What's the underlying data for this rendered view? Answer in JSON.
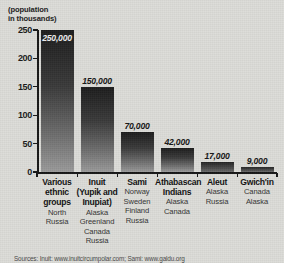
{
  "chart_data": {
    "type": "bar",
    "title": "",
    "axis_title": "(population\nin thousands)",
    "xlabel": "",
    "ylabel": "(population in thousands)",
    "ylim": [
      0,
      250
    ],
    "yticks": [
      0,
      50,
      100,
      150,
      200,
      250
    ],
    "ytick_labels": [
      "0",
      "50",
      "100",
      "150",
      "200",
      "250"
    ],
    "grid": false,
    "legend": "none",
    "units": "thousands",
    "categories": [
      "Various ethnic groups",
      "Inuit (Yupik and Inupiat)",
      "Sami",
      "Athabascan Indians",
      "Aleut",
      "Gwich'in"
    ],
    "values": [
      250,
      150,
      70,
      42,
      17,
      9
    ],
    "data_labels": [
      "250,000",
      "150,000",
      "70,000",
      "42,000",
      "17,000",
      "9,000"
    ],
    "raw_values": [
      250000,
      150000,
      70000,
      42000,
      17000,
      9000
    ],
    "bars": [
      {
        "name_lines": [
          "Various",
          "ethnic",
          "groups"
        ],
        "regions": [
          "North",
          "Russia"
        ],
        "value": 250,
        "label": "250,000",
        "label_position": "inside"
      },
      {
        "name_lines": [
          "Inuit",
          "(Yupik and",
          "Inupiat)"
        ],
        "regions": [
          "Alaska",
          "Greenland",
          "Canada",
          "Russia"
        ],
        "value": 150,
        "label": "150,000",
        "label_position": "above"
      },
      {
        "name_lines": [
          "Sami"
        ],
        "regions": [
          "Norway",
          "Sweden",
          "Finland",
          "Russia"
        ],
        "value": 70,
        "label": "70,000",
        "label_position": "above"
      },
      {
        "name_lines": [
          "Athabascan",
          "Indians"
        ],
        "regions": [
          "Alaska",
          "Canada"
        ],
        "value": 42,
        "label": "42,000",
        "label_position": "above"
      },
      {
        "name_lines": [
          "Aleut"
        ],
        "regions": [
          "Alaska",
          "Russia"
        ],
        "value": 17,
        "label": "17,000",
        "label_position": "above"
      },
      {
        "name_lines": [
          "Gwich'in"
        ],
        "regions": [
          "Canada",
          "Alaska"
        ],
        "value": 9,
        "label": "9,000",
        "label_position": "above"
      }
    ]
  },
  "source": {
    "text": "Sources: Inuit: www.inuitcircumpolar.com;  Sami: www.galdu.org"
  },
  "colors": {
    "background": "#dcdcd8",
    "axis": "#161616",
    "bar_top": "#1d1d1d",
    "bar_bottom": "#9a9a9a",
    "text": "#121212"
  }
}
